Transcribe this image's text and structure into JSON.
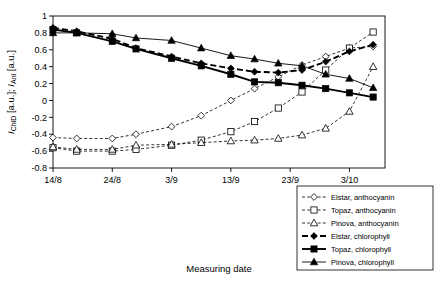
{
  "chart_data": {
    "type": "line",
    "title": "",
    "xlabel": "Measuring date",
    "ylabel": "I_ChlD [a.u.]; I_Anl [a.u.]",
    "ylabel_parts": {
      "p1": "I",
      "p1sub": "ChlD",
      "p2": " [a.u.]; ",
      "p3": "I",
      "p3sub": "Anl",
      "p4": " [a.u.]"
    },
    "x_ticks": [
      "14/8",
      "24/8",
      "3/9",
      "13/9",
      "23/9",
      "3/10"
    ],
    "x_tick_values": [
      0,
      10,
      20,
      30,
      40,
      50
    ],
    "xlim": [
      0,
      56
    ],
    "ylim": [
      -0.8,
      1.0
    ],
    "y_ticks": [
      "1",
      "0.8",
      "0.6",
      "0.4",
      "0.2",
      "0",
      "-0.2",
      "-0.4",
      "-0.6",
      "-0.8"
    ],
    "y_tick_values": [
      1,
      0.8,
      0.6,
      0.4,
      0.2,
      0,
      -0.2,
      -0.4,
      -0.6,
      -0.8
    ],
    "grid": false,
    "legend_position": "bottom-right",
    "legend": [
      "Elstar, anthocyanin",
      "Topaz, anthocyanin",
      "Pinova, anthocyanin",
      "Elstar, chlorophyll",
      "Topaz, chlorophyll",
      "Pinova, chlorophyll"
    ],
    "series": [
      {
        "name": "Elstar, anthocyanin",
        "marker": "diamond-open",
        "line": "dashed",
        "x": [
          0,
          4,
          10,
          14,
          20,
          25,
          30,
          34,
          38,
          42,
          46,
          50,
          54
        ],
        "y": [
          -0.44,
          -0.45,
          -0.45,
          -0.4,
          -0.31,
          -0.18,
          0.0,
          0.14,
          0.28,
          0.42,
          0.52,
          0.62,
          0.64
        ]
      },
      {
        "name": "Topaz, anthocyanin",
        "marker": "square-open",
        "line": "dashed",
        "x": [
          0,
          4,
          10,
          14,
          20,
          25,
          30,
          34,
          38,
          42,
          46,
          50,
          54
        ],
        "y": [
          -0.56,
          -0.6,
          -0.6,
          -0.58,
          -0.53,
          -0.47,
          -0.37,
          -0.25,
          -0.09,
          0.1,
          0.36,
          0.62,
          0.81
        ]
      },
      {
        "name": "Pinova, anthocyanin",
        "marker": "triangle-open",
        "line": "dashed",
        "x": [
          0,
          4,
          10,
          14,
          20,
          25,
          30,
          34,
          38,
          42,
          46,
          50,
          54
        ],
        "y": [
          -0.55,
          -0.58,
          -0.58,
          -0.53,
          -0.52,
          -0.5,
          -0.48,
          -0.47,
          -0.45,
          -0.41,
          -0.33,
          -0.13,
          0.4
        ]
      },
      {
        "name": "Elstar, chlorophyll",
        "marker": "diamond-filled",
        "line": "dashed-thick",
        "x": [
          0,
          4,
          10,
          14,
          20,
          25,
          30,
          34,
          38,
          42,
          46,
          50,
          54
        ],
        "y": [
          0.86,
          0.82,
          0.73,
          0.62,
          0.52,
          0.44,
          0.38,
          0.34,
          0.33,
          0.36,
          0.46,
          0.58,
          0.66
        ]
      },
      {
        "name": "Topaz, chlorophyll",
        "marker": "square-filled",
        "line": "solid-thick",
        "x": [
          0,
          4,
          10,
          14,
          20,
          25,
          30,
          34,
          38,
          42,
          46,
          50,
          54
        ],
        "y": [
          0.84,
          0.8,
          0.7,
          0.61,
          0.5,
          0.41,
          0.31,
          0.22,
          0.21,
          0.18,
          0.14,
          0.09,
          0.04
        ]
      },
      {
        "name": "Pinova, chlorophyll",
        "marker": "triangle-filled",
        "line": "solid",
        "x": [
          0,
          4,
          10,
          14,
          20,
          25,
          30,
          34,
          38,
          42,
          46,
          50,
          54
        ],
        "y": [
          0.8,
          0.8,
          0.79,
          0.74,
          0.71,
          0.62,
          0.53,
          0.49,
          0.44,
          0.41,
          0.31,
          0.26,
          0.15
        ]
      }
    ]
  }
}
